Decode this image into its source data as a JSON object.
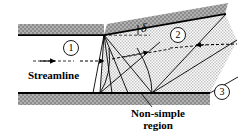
{
  "figure": {
    "width": 241,
    "height": 140,
    "background": "#ffffff"
  },
  "colors": {
    "wall_fill": "#a8a8a8",
    "wall_line": "#000000",
    "region_fill": "#d9d9d9",
    "line": "#000000",
    "text": "#000000"
  },
  "labels": {
    "streamline": "Streamline",
    "non_simple_line1": "Non-simple",
    "non_simple_line2": "region",
    "delta": "δ"
  },
  "stations": [
    {
      "id": "1",
      "label": "1",
      "cx": 71,
      "cy": 48,
      "r": 7.5
    },
    {
      "id": "2",
      "label": "2",
      "cx": 178,
      "cy": 35,
      "r": 7.5
    },
    {
      "id": "3",
      "label": "3",
      "cx": 222,
      "cy": 92,
      "r": 7.5
    }
  ],
  "geometry": {
    "upper_wall_inlet": {
      "x1": 18,
      "y1": 35,
      "x2": 104,
      "y2": 35
    },
    "upper_wall_deflected": {
      "x1": 104,
      "y1": 35,
      "x2": 225,
      "y2": 14
    },
    "lower_wall": {
      "x1": 18,
      "y1": 93,
      "x2": 210,
      "y2": 93
    },
    "corner": {
      "x": 104,
      "y": 35
    },
    "deflection_angle_deg": 10,
    "expansion_fan_origin": {
      "x": 104,
      "y": 35
    },
    "fan_rays_count": 5,
    "reflection_points": [
      {
        "x": 100,
        "y": 93
      },
      {
        "x": 152,
        "y": 93
      }
    ]
  },
  "arrows": {
    "streamline_inlet": {
      "x1": 33,
      "y1": 61,
      "x2": 104,
      "y2": 61
    },
    "streamline_mid": {
      "x1": 104,
      "y1": 61,
      "x2": 146,
      "y2": 54
    },
    "streamline_exit": {
      "x1": 146,
      "y1": 54,
      "x2": 236,
      "y2": 44
    }
  },
  "hatching": {
    "wall_pattern": "diagonal-hatch",
    "region_pattern": "dot-stipple"
  },
  "icon_names": {
    "arrow": "arrow-right-icon",
    "angle_marker": "angle-delta-icon",
    "leader": "leader-line-icon"
  }
}
